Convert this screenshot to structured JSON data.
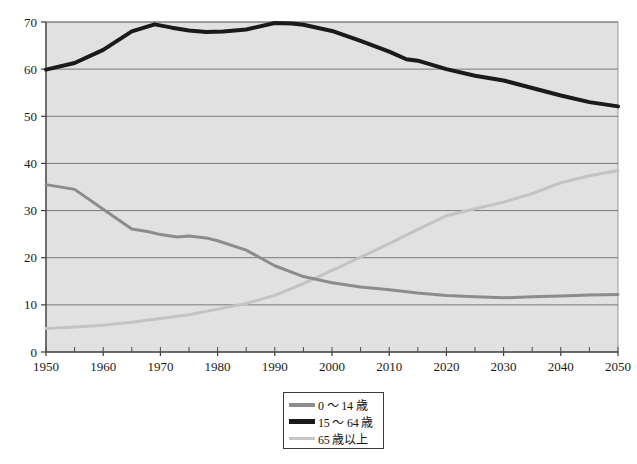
{
  "chart_data": {
    "type": "line",
    "title": "",
    "subtitle": "",
    "xlabel": "",
    "ylabel": "",
    "xlim": [
      1950,
      2050
    ],
    "ylim": [
      0,
      70
    ],
    "ytick_labels": [
      "0",
      "10",
      "20",
      "30",
      "40",
      "50",
      "60",
      "70"
    ],
    "yticks": [
      0,
      10,
      20,
      30,
      40,
      50,
      60,
      70
    ],
    "xtick_labels": [
      "1950",
      "1960",
      "1970",
      "1980",
      "1990",
      "2000",
      "2010",
      "2020",
      "2030",
      "2040",
      "2050"
    ],
    "xticks": [
      1950,
      1960,
      1970,
      1980,
      1990,
      2000,
      2010,
      2020,
      2030,
      2040,
      2050
    ],
    "x_minor_interval": 5,
    "grid": "horizontal",
    "legend_position": "bottom-center",
    "plot_background": "#e4e4e4",
    "series": [
      {
        "name": "0 ～ 14 歳",
        "color": "#8c8c8c",
        "width": 3,
        "x": [
          1950,
          1955,
          1960,
          1965,
          1968,
          1970,
          1973,
          1975,
          1978,
          1980,
          1985,
          1990,
          1995,
          2000,
          2005,
          2010,
          2015,
          2020,
          2025,
          2030,
          2035,
          2040,
          2045,
          2050
        ],
        "values": [
          35.5,
          34.5,
          30.3,
          26.1,
          25.5,
          24.9,
          24.4,
          24.6,
          24.2,
          23.6,
          21.6,
          18.3,
          16.0,
          14.7,
          13.8,
          13.2,
          12.5,
          12.0,
          11.7,
          11.5,
          11.7,
          11.9,
          12.1,
          12.2
        ]
      },
      {
        "name": "15 ～ 64 歳",
        "color": "#1a1a1a",
        "width": 4,
        "x": [
          1950,
          1955,
          1960,
          1965,
          1969,
          1972,
          1975,
          1978,
          1981,
          1985,
          1990,
          1993,
          1995,
          2000,
          2005,
          2010,
          2013,
          2015,
          2020,
          2025,
          2030,
          2035,
          2040,
          2045,
          2050
        ],
        "values": [
          59.9,
          61.3,
          64.1,
          68.0,
          69.5,
          68.8,
          68.2,
          67.9,
          68.0,
          68.4,
          69.8,
          69.7,
          69.4,
          68.1,
          66.0,
          63.7,
          62.1,
          61.8,
          60.0,
          58.6,
          57.6,
          56.0,
          54.4,
          53.0,
          52.1
        ]
      },
      {
        "name": "65 歳以上",
        "color": "#c3c3c3",
        "width": 3,
        "x": [
          1950,
          1955,
          1960,
          1965,
          1970,
          1975,
          1980,
          1985,
          1990,
          1995,
          2000,
          2005,
          2010,
          2015,
          2020,
          2025,
          2030,
          2035,
          2040,
          2045,
          2050
        ],
        "values": [
          5.0,
          5.3,
          5.7,
          6.3,
          7.1,
          7.9,
          9.1,
          10.3,
          12.0,
          14.5,
          17.3,
          20.1,
          23.0,
          26.0,
          28.9,
          30.4,
          31.8,
          33.6,
          35.9,
          37.4,
          38.5
        ]
      }
    ]
  },
  "legend": {
    "items": [
      {
        "label": "0 ～ 14 歳",
        "color": "#8c8c8c",
        "thickness": 4
      },
      {
        "label": "15 ～ 64 歳",
        "color": "#1a1a1a",
        "thickness": 5
      },
      {
        "label": "65 歳以上",
        "color": "#c6c6c6",
        "thickness": 3
      }
    ]
  }
}
